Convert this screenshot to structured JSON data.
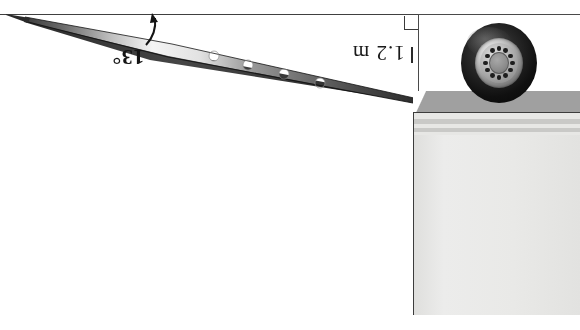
{
  "diagram": {
    "orientation": "rotated-180",
    "labels": {
      "angle": "13°",
      "height": "1.2 m"
    },
    "markers": {
      "right_angle": "right-angle-marker",
      "dimension_tick": "dimension-tick"
    },
    "icons": {
      "wheel": "truck-wheel-icon",
      "ramp": "loading-ramp-icon",
      "ground": "ground-line-icon",
      "trailer": "trailer-body-icon"
    },
    "colors": {
      "ground_line": "#404040",
      "ramp_dark": "#2b2b2b",
      "ramp_light": "#f2f2f2",
      "platform": "#a0a0a0",
      "body_panel": "#e7e7e5",
      "body_stripe": "#c9c9c7",
      "tire": "#101010",
      "rim": "#c8c8c8",
      "outline": "#3c3c3c"
    },
    "geometry": {
      "angle_degrees": 13,
      "height_meters": 1.2,
      "ramp_hole_count": 5,
      "wheel_lug_count": 12
    }
  }
}
